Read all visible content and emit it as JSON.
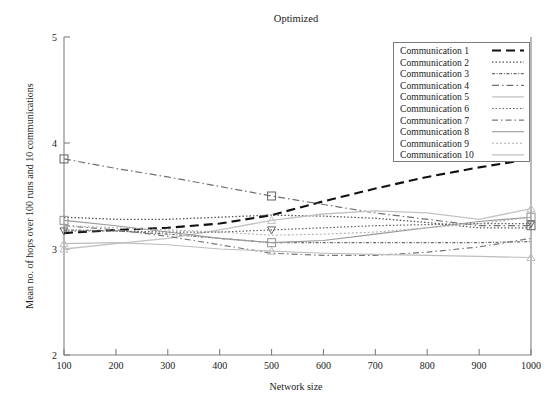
{
  "chart_data": {
    "type": "line",
    "title": "Optimized",
    "xlabel": "Network size",
    "ylabel": "Mean no. of hops over 100 runs and 10 communications",
    "xlim": [
      100,
      1000
    ],
    "ylim": [
      2,
      5
    ],
    "xticks": [
      100,
      200,
      300,
      400,
      500,
      600,
      700,
      800,
      900,
      1000
    ],
    "xtick_labels": [
      "100",
      "200",
      "300",
      "400",
      "500",
      "600",
      "700",
      "800",
      "900",
      "1000"
    ],
    "yticks": [
      2,
      3,
      4,
      5
    ],
    "ytick_labels": [
      "2",
      "3",
      "4",
      "5"
    ],
    "grid": false,
    "legend_position": "top-right",
    "x": [
      100,
      200,
      300,
      400,
      500,
      600,
      700,
      800,
      900,
      1000
    ],
    "series": [
      {
        "name": "Communication 1",
        "values": [
          3.15,
          3.18,
          3.2,
          3.24,
          3.32,
          3.45,
          3.57,
          3.68,
          3.77,
          3.85
        ],
        "color": "#111111",
        "dash": "9,5",
        "width": 2.1,
        "marker": "none"
      },
      {
        "name": "Communication 2",
        "values": [
          3.3,
          3.28,
          3.28,
          3.3,
          3.32,
          3.31,
          3.29,
          3.25,
          3.2,
          3.2
        ],
        "color": "#555555",
        "dash": "1.5,2",
        "width": 1.3,
        "marker": "none"
      },
      {
        "name": "Communication 3",
        "values": [
          3.18,
          3.17,
          3.14,
          3.1,
          3.06,
          3.06,
          3.06,
          3.06,
          3.06,
          3.07
        ],
        "color": "#6a6a6a",
        "dash": "3,1.6,1,1.6",
        "width": 1.2,
        "marker": "none"
      },
      {
        "name": "Communication 4",
        "values": [
          3.85,
          3.76,
          3.68,
          3.59,
          3.5,
          3.42,
          3.34,
          3.28,
          3.22,
          3.22
        ],
        "color": "#707070",
        "dash": "7,3,1.5,3",
        "width": 1.2,
        "marker": "square"
      },
      {
        "name": "Communication 5",
        "values": [
          3.0,
          3.05,
          3.1,
          3.18,
          3.27,
          3.33,
          3.36,
          3.34,
          3.28,
          3.38
        ],
        "color": "#c2c2c2",
        "dash": "none",
        "width": 1.3,
        "marker": "triangle-up"
      },
      {
        "name": "Communication 6",
        "values": [
          3.17,
          3.17,
          3.16,
          3.16,
          3.18,
          3.2,
          3.22,
          3.23,
          3.24,
          3.24
        ],
        "color": "#5f5f5f",
        "dash": "1.5,2",
        "width": 1.2,
        "marker": "triangle-down"
      },
      {
        "name": "Communication 7",
        "values": [
          3.22,
          3.18,
          3.12,
          3.04,
          2.96,
          2.94,
          2.94,
          2.97,
          3.02,
          3.1
        ],
        "color": "#787878",
        "dash": "6,3,1.5,3",
        "width": 1.2,
        "marker": "none"
      },
      {
        "name": "Communication 8",
        "values": [
          3.27,
          3.22,
          3.16,
          3.1,
          3.06,
          3.08,
          3.14,
          3.2,
          3.26,
          3.3
        ],
        "color": "#9a9a9a",
        "dash": "none",
        "width": 1.1,
        "marker": "square"
      },
      {
        "name": "Communication 9",
        "values": [
          3.22,
          3.2,
          3.18,
          3.16,
          3.13,
          3.14,
          3.16,
          3.2,
          3.24,
          3.3
        ],
        "color": "#b0b0b0",
        "dash": "2,2",
        "width": 1.1,
        "marker": "none"
      },
      {
        "name": "Communication 10",
        "values": [
          3.05,
          3.06,
          3.04,
          3.0,
          2.98,
          2.96,
          2.95,
          2.94,
          2.93,
          2.92
        ],
        "color": "#bdbdbd",
        "dash": "none",
        "width": 1.2,
        "marker": "triangle-up"
      }
    ]
  },
  "legend": {
    "entries": [
      "Communication 1",
      "Communication 2",
      "Communication 3",
      "Communication 4",
      "Communication 5",
      "Communication 6",
      "Communication 7",
      "Communication 8",
      "Communication 9",
      "Communication 10"
    ]
  }
}
